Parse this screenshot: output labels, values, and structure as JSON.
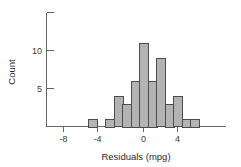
{
  "chart_data": {
    "type": "bar",
    "title": "",
    "subtitle": "",
    "xlabel": "Residuals (mpg)",
    "ylabel": "Count",
    "grid": false,
    "legend": null,
    "bin_width": 1,
    "xlim": [
      -9,
      6.5
    ],
    "ylim": [
      0,
      15
    ],
    "x_ticks": [
      -8,
      -4,
      0,
      4
    ],
    "x_tick_labels": [
      "-8",
      "-4",
      "0",
      "4"
    ],
    "y_ticks": [
      5,
      10
    ],
    "y_tick_labels": [
      "5",
      "10"
    ],
    "y_minor_ticks": [
      0,
      15
    ],
    "bin_starts": [
      -6.5,
      -4.5,
      -3.5,
      -2.5,
      -1.5,
      -0.5,
      0.5,
      1.5,
      2.5,
      3.5,
      4.5,
      5.5
    ],
    "categories": [
      "-6.5",
      "-4.5",
      "-3.5",
      "-2.5",
      "-1.5",
      "-0.5",
      "0.5",
      "1.5",
      "2.5",
      "3.5",
      "4.5",
      "5.5"
    ],
    "values": [
      1,
      1,
      4,
      3,
      6,
      11,
      6,
      9,
      3,
      4,
      1,
      1
    ],
    "colors": {
      "bar_fill": "#b3b3b3",
      "bar_stroke": "#4d4d4d",
      "axis": "#666666",
      "text": "#2b2b2b",
      "background": "#ffffff"
    }
  }
}
